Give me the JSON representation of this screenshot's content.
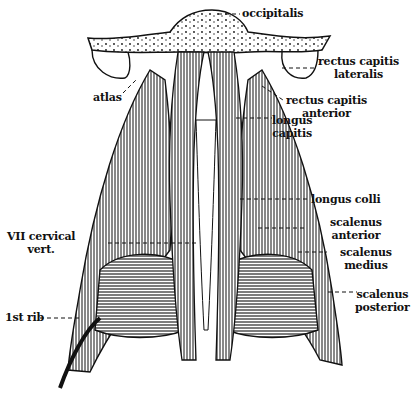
{
  "figure": {
    "colors": {
      "ink": "#111111",
      "paper": "#ffffff"
    }
  },
  "labels": {
    "occipitalis": {
      "lines": [
        "occipitalis"
      ]
    },
    "rectus_capitis_lateralis": {
      "lines": [
        "rectus capitis",
        "lateralis"
      ]
    },
    "atlas": {
      "lines": [
        "atlas"
      ]
    },
    "rectus_capitis_anterior": {
      "lines": [
        "rectus capitis",
        "anterior"
      ]
    },
    "longus_capitis": {
      "lines": [
        "longus",
        "capitis"
      ]
    },
    "longus_colli": {
      "lines": [
        "longus colli"
      ]
    },
    "scalenus_anterior": {
      "lines": [
        "scalenus",
        "anterior"
      ]
    },
    "vii_cervical_vert": {
      "lines": [
        "VII cervical",
        "vert."
      ]
    },
    "scalenus_medius": {
      "lines": [
        "scalenus",
        "medius"
      ]
    },
    "scalenus_posterior": {
      "lines": [
        "scalenus",
        "posterior"
      ]
    },
    "first_rib": {
      "lines": [
        "1st rib"
      ]
    }
  }
}
